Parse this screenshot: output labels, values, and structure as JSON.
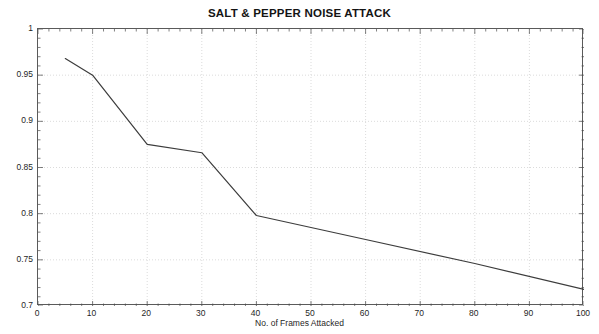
{
  "chart_data": {
    "type": "line",
    "title": "SALT & PEPPER NOISE ATTACK",
    "xlabel": "No. of Frames Attacked",
    "ylabel": "NC",
    "xlim": [
      0,
      100
    ],
    "ylim": [
      0.7,
      1
    ],
    "grid": true,
    "legend": null,
    "xticks": [
      0,
      10,
      20,
      30,
      40,
      50,
      60,
      70,
      80,
      90,
      100
    ],
    "xtick_labels": [
      "0",
      "10",
      "20",
      "30",
      "40",
      "50",
      "60",
      "70",
      "80",
      "90",
      "100"
    ],
    "yticks": [
      0.7,
      0.75,
      0.8,
      0.85,
      0.9,
      0.95,
      1
    ],
    "ytick_labels": [
      "0.7",
      "0.75",
      "0.8",
      "0.85",
      "0.9",
      "0.95",
      "1"
    ],
    "series": [
      {
        "name": "NC",
        "color": "#3c3c3c",
        "x": [
          5,
          10,
          20,
          30,
          40,
          60,
          80,
          100
        ],
        "y": [
          0.968,
          0.95,
          0.875,
          0.866,
          0.798,
          0.772,
          0.746,
          0.718
        ]
      }
    ]
  }
}
